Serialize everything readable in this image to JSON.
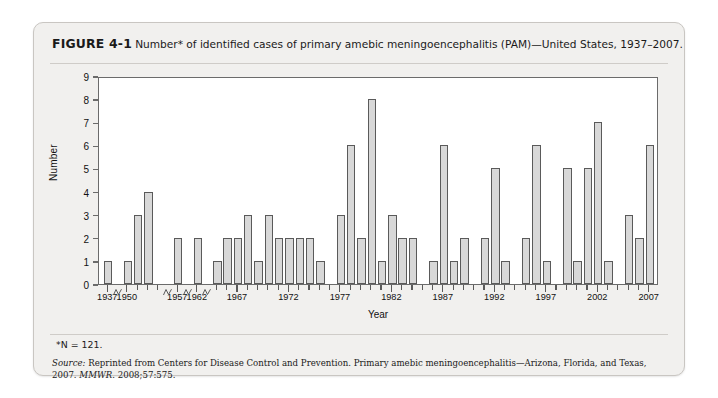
{
  "figure": {
    "number_label": "FIGURE 4-1",
    "caption": "Number* of identified cases of primary amebic meningoencephalitis (PAM)—United States, 1937–2007.",
    "footnote": "*N = 121.",
    "source_prefix": "Source:",
    "source_text": " Reprinted from Centers for Disease Control and Prevention. Primary amebic meningoencephalitis—Arizona, Florida, and Texas, 2007. ",
    "source_journal": "MMWR.",
    "source_citation": " 2008;57:575."
  },
  "colors": {
    "card_background": "#f1f0ee",
    "card_border": "#c9c6c2",
    "plot_background": "#ffffff",
    "axis": "#6b6b6b",
    "bar_fill": "#d8d8d8",
    "bar_stroke": "#5a5a5a",
    "text": "#1a1a1a"
  },
  "chart_data": {
    "type": "bar",
    "title": "Number* of identified cases of primary amebic meningoencephalitis (PAM)—United States, 1937–2007.",
    "xlabel": "Year",
    "ylabel": "Number",
    "ylim": [
      0,
      9
    ],
    "yticks": [
      0,
      1,
      2,
      3,
      4,
      5,
      6,
      7,
      8,
      9
    ],
    "grid": false,
    "legend": null,
    "total_label": "*N = 121.",
    "total": 121,
    "axis_breaks": [
      "1938-1949",
      "1953-1956",
      "1958-1961",
      "1963-1964"
    ],
    "x_tick_labels": [
      "1937",
      "1950",
      "1957",
      "1962",
      "1967",
      "1972",
      "1977",
      "1982",
      "1987",
      "1992",
      "1997",
      "2002",
      "2007"
    ],
    "categories": [
      "1937",
      "1950",
      "1951",
      "1952",
      "1953",
      "1957",
      "1962",
      "1965",
      "1966",
      "1967",
      "1968",
      "1969",
      "1970",
      "1971",
      "1972",
      "1973",
      "1974",
      "1975",
      "1976",
      "1977",
      "1978",
      "1979",
      "1980",
      "1981",
      "1982",
      "1983",
      "1984",
      "1985",
      "1986",
      "1987",
      "1988",
      "1989",
      "1990",
      "1991",
      "1992",
      "1993",
      "1994",
      "1995",
      "1996",
      "1997",
      "1998",
      "1999",
      "2000",
      "2001",
      "2002",
      "2003",
      "2004",
      "2005",
      "2006",
      "2007"
    ],
    "values": [
      1,
      1,
      3,
      4,
      0,
      2,
      2,
      1,
      2,
      2,
      3,
      1,
      3,
      2,
      2,
      2,
      2,
      1,
      0,
      3,
      6,
      2,
      8,
      1,
      3,
      2,
      2,
      0,
      1,
      6,
      1,
      2,
      0,
      2,
      5,
      1,
      0,
      2,
      6,
      1,
      0,
      5,
      1,
      5,
      7,
      1,
      0,
      3,
      2,
      6
    ]
  }
}
